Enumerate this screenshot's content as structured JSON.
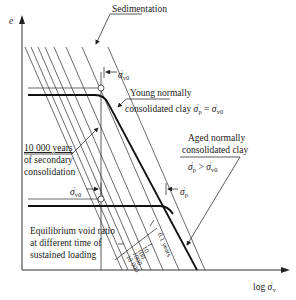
{
  "diagram": {
    "type": "e-log-sigma consolidation diagram (Bjerrum delayed compression)",
    "axes": {
      "y_label": "e",
      "x_label": "log σ'v"
    },
    "annotations": {
      "sedimentation": "Sedimentation",
      "sigma_v0_top": "σ'v0",
      "young_line1": "Young normally",
      "young_line2": "consolidated clay",
      "young_eq": "σ'p = σ'v0",
      "aged_line1": "Aged normally",
      "aged_line2": "consolidated clay",
      "aged_eq": "σ'p > σ'v0",
      "years_line1": "10 000 years",
      "years_line2": "of secondary",
      "years_line3": "consolidation",
      "sigma_v0_bottom": "σ'v0",
      "sigma_p": "σ'p",
      "equil_line1": "Equilibrium void ratio",
      "equil_line2": "at different time of",
      "equil_line3": "sustained loading"
    },
    "time_lines": [
      "0.1 years",
      "1",
      "10",
      "100",
      "1000",
      "10 000"
    ],
    "colors": {
      "line": "#333333",
      "thick": "#111111",
      "background": "#ffffff"
    }
  }
}
